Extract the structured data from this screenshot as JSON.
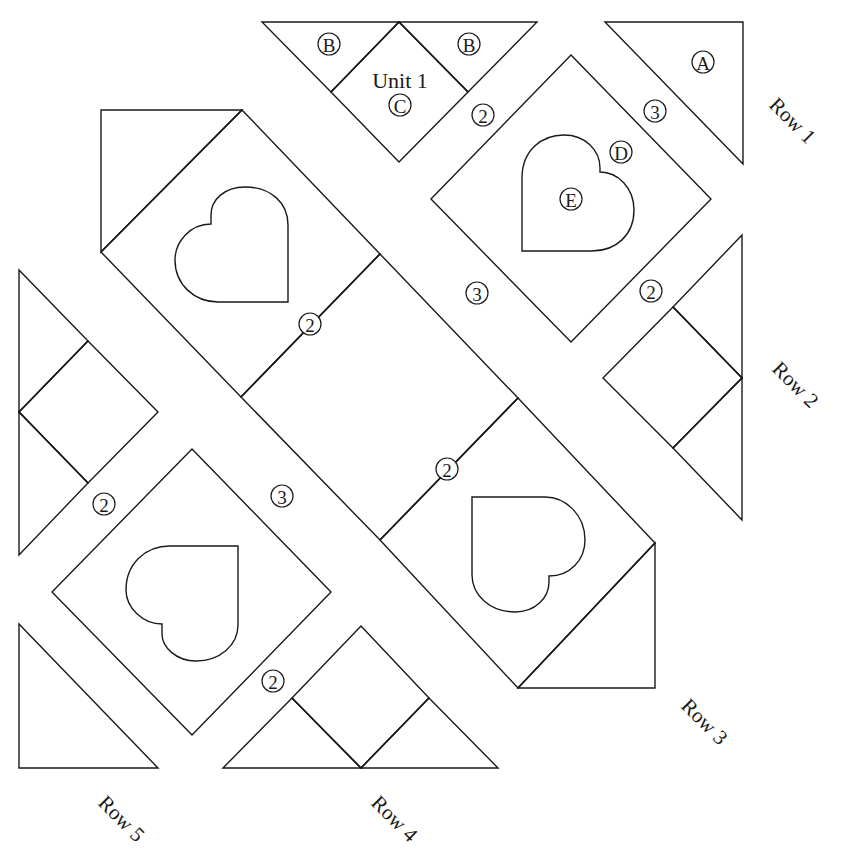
{
  "diagram": {
    "type": "quilt block assembly diagram",
    "stroke_color": "#1a1a1a",
    "background": "#ffffff",
    "unit_label": "Unit 1",
    "piece_labels": {
      "A": "A",
      "B_left": "B",
      "B_right": "B",
      "C": "C",
      "D": "D",
      "E": "E"
    },
    "seam_labels": {
      "row1_unit_join": "2",
      "row1_a_join": "3",
      "row2_join": "2",
      "row3_upper_join": "2",
      "row3_lower_join": "2",
      "row3_to_row2": "3",
      "row3_to_row4": "3",
      "row4_join": "2",
      "row5_join": "2"
    },
    "row_labels": [
      "Row 1",
      "Row 2",
      "Row 3",
      "Row 4",
      "Row 5"
    ]
  }
}
